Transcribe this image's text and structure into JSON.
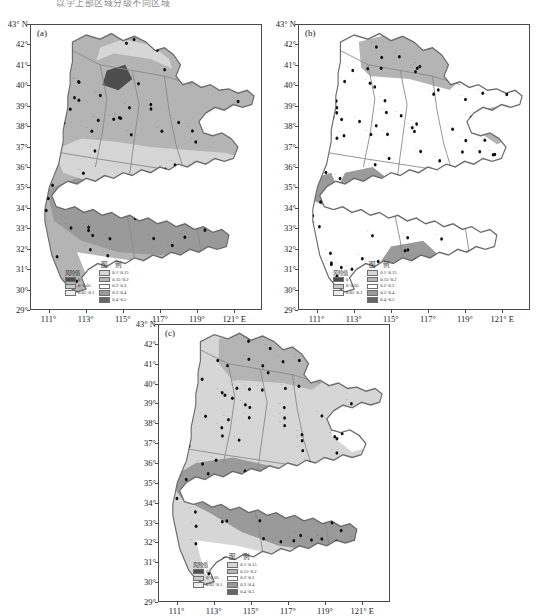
{
  "figure": {
    "clipped_caption_top": "以学上部区域分级不同区域",
    "type": "choropleth-map-series",
    "panels": [
      {
        "tag": "(a)"
      },
      {
        "tag": "(b)"
      },
      {
        "tag": "(c)"
      }
    ]
  },
  "axes": {
    "y_ticks": [
      "43° N",
      "42°",
      "41°",
      "40°",
      "39°",
      "38°",
      "37°",
      "36°",
      "35°",
      "34°",
      "33°",
      "32°",
      "31°",
      "30°",
      "29°"
    ],
    "y_values": [
      43,
      42,
      41,
      40,
      39,
      38,
      37,
      36,
      35,
      34,
      33,
      32,
      31,
      30,
      29
    ],
    "x_ticks": [
      "111°",
      "113°",
      "115°",
      "117°",
      "119°",
      "121° E"
    ],
    "x_values": [
      111,
      113,
      115,
      117,
      119,
      121
    ],
    "ylim": [
      29,
      43
    ],
    "xlim": [
      110,
      122.5
    ],
    "xlabel": "",
    "ylabel": ""
  },
  "legend": {
    "title": "图  例",
    "value_header": "风险值",
    "left_items": [
      {
        "label": "0",
        "color": "#4d4d4d"
      },
      {
        "label": "0~0.05",
        "color": "#c9c9c9"
      },
      {
        "label": "0.05~0.1",
        "color": "#ededed"
      }
    ],
    "right_items": [
      {
        "label": "0.1~0.15",
        "color": "#d6d6d6"
      },
      {
        "label": "0.15~0.2",
        "color": "#b4b4b4"
      },
      {
        "label": "0.2~0.3",
        "color": "#ffffff"
      },
      {
        "label": "0.3~0.4",
        "color": "#9a9a9a"
      },
      {
        "label": "0.4~0.5",
        "color": "#666666"
      }
    ]
  },
  "chart_data": {
    "type": "heatmap",
    "title": "",
    "xlabel": "Longitude (° E)",
    "ylabel": "Latitude (° N)",
    "xlim": [
      110,
      122.5
    ],
    "ylim": [
      29,
      43
    ],
    "grid": false,
    "legend_position": "inside-bottom-left",
    "variable": "风险值 (risk value)",
    "class_breaks": [
      0,
      0.05,
      0.1,
      0.15,
      0.2,
      0.3,
      0.4,
      0.5
    ],
    "class_labels": [
      "0",
      "0~0.05",
      "0.05~0.1",
      "0.1~0.15",
      "0.15~0.2",
      "0.2~0.3",
      "0.3~0.4",
      "0.4~0.5"
    ],
    "class_colors": [
      "#4d4d4d",
      "#c9c9c9",
      "#ededed",
      "#d6d6d6",
      "#b4b4b4",
      "#ffffff",
      "#9a9a9a",
      "#666666"
    ],
    "panels": [
      {
        "name": "(a)",
        "description": "Broad north-central moderate band with dark maximum patches in the far north-east and a north-west spot; a continuous higher-risk belt sweeps across the southern third.",
        "regions": [
          {
            "zone": "far north-east border",
            "class": "0.4~0.5",
            "value": 0.45
          },
          {
            "zone": "north-west spot",
            "class": "0.4~0.5",
            "value": 0.44
          },
          {
            "zone": "northern plateau",
            "class": "0.15~0.2",
            "value": 0.17
          },
          {
            "zone": "central plain",
            "class": "0.15~0.2",
            "value": 0.18
          },
          {
            "zone": "west mountains",
            "class": "0.1~0.15",
            "value": 0.12
          },
          {
            "zone": "southern belt",
            "class": "0.3~0.4",
            "value": 0.35
          },
          {
            "zone": "far south",
            "class": "0.2~0.3",
            "value": 0.22
          }
        ]
      },
      {
        "name": "(b)",
        "description": "Mostly low risk; isolated dark patches at the south-west interior and a larger dark lobe in the south-centre, with a moderate band along the north and the eastern peninsula.",
        "regions": [
          {
            "zone": "north border band",
            "class": "0.15~0.2",
            "value": 0.17
          },
          {
            "zone": "eastern peninsula",
            "class": "0.15~0.2",
            "value": 0.16
          },
          {
            "zone": "south-west interior patch",
            "class": "0.3~0.4",
            "value": 0.33
          },
          {
            "zone": "south-central lobe",
            "class": "0.3~0.4",
            "value": 0.34
          },
          {
            "zone": "central plain",
            "class": "0.2~0.3",
            "value": 0.24
          },
          {
            "zone": "western edge",
            "class": "0.3~0.4",
            "value": 0.31
          }
        ]
      },
      {
        "name": "(c)",
        "description": "A pronounced dark high-risk band runs diagonally across the middle latitudes (33°–35°N) and widens toward the south-east; the north is moderate and the far south is low.",
        "regions": [
          {
            "zone": "central diagonal band",
            "class": "0.3~0.4",
            "value": 0.36
          },
          {
            "zone": "south-east extension",
            "class": "0.3~0.4",
            "value": 0.35
          },
          {
            "zone": "northern plateau",
            "class": "0.15~0.2",
            "value": 0.17
          },
          {
            "zone": "north-east hills",
            "class": "0.15~0.2",
            "value": 0.18
          },
          {
            "zone": "central-north plain",
            "class": "0.1~0.15",
            "value": 0.13
          },
          {
            "zone": "eastern peninsula",
            "class": "0.2~0.3",
            "value": 0.23
          },
          {
            "zone": "far south",
            "class": "0.2~0.3",
            "value": 0.21
          }
        ]
      }
    ]
  },
  "stations": {
    "marker": "filled-circle",
    "count_per_panel": 120,
    "label_style": "chinese-place-name"
  }
}
